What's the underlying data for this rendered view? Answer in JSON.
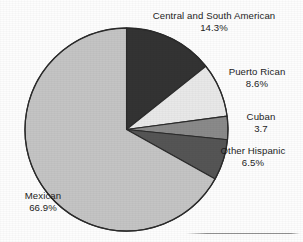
{
  "chart_data": {
    "type": "pie",
    "title": "",
    "subtitle": "",
    "xlabel": "",
    "ylabel": "",
    "legend_position": "none",
    "grid": false,
    "labels_outside": true,
    "start_angle_deg": 0,
    "direction": "clockwise",
    "categories": [
      "Central and South American",
      "Puerto Rican",
      "Cuban",
      "Other Hispanic",
      "Mexican"
    ],
    "values": [
      14.3,
      8.6,
      3.7,
      6.5,
      66.9
    ],
    "value_labels": [
      "14.3%",
      "8.6%",
      "3.7",
      "6.5%",
      "66.9%"
    ],
    "colors": [
      "#333333",
      "#e8e8e8",
      "#8a8a8a",
      "#555555",
      "#c4c4c4"
    ],
    "slices": [
      {
        "name": "Central and South American",
        "value": 14.3,
        "value_label": "14.3%",
        "color": "#333333"
      },
      {
        "name": "Puerto Rican",
        "value": 8.6,
        "value_label": "8.6%",
        "color": "#e8e8e8"
      },
      {
        "name": "Cuban",
        "value": 3.7,
        "value_label": "3.7",
        "color": "#8a8a8a"
      },
      {
        "name": "Other Hispanic",
        "value": 6.5,
        "value_label": "6.5%",
        "color": "#555555"
      },
      {
        "name": "Mexican",
        "value": 66.9,
        "value_label": "66.9%",
        "color": "#c4c4c4"
      }
    ]
  },
  "labels": {
    "central": {
      "name": "Central and South American",
      "value": "14.3%"
    },
    "puerto": {
      "name": "Puerto Rican",
      "value": "8.6%"
    },
    "cuban": {
      "name": "Cuban",
      "value": "3.7"
    },
    "other": {
      "name": "Other Hispanic",
      "value": "6.5%"
    },
    "mexican": {
      "name": "Mexican",
      "value": "66.9%"
    }
  },
  "style": {
    "outline_color": "#2b2b2b",
    "background": "#fdfdfd",
    "text_color": "#1c1c1c"
  }
}
